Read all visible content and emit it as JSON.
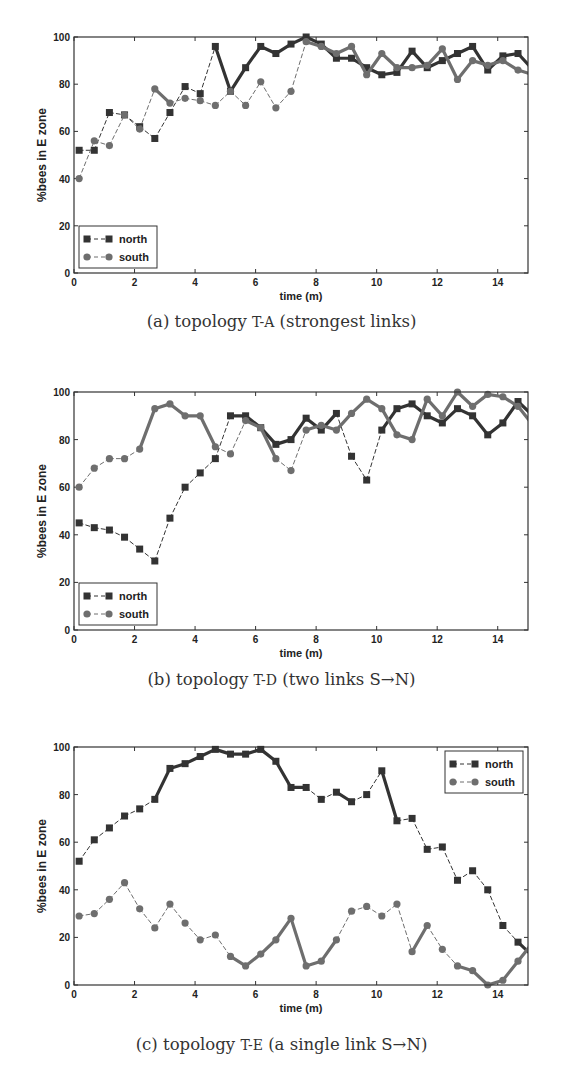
{
  "chart_data": [
    {
      "type": "line",
      "panel": "a",
      "caption_prefix": "(a) topology ",
      "caption_topology": "T-A",
      "caption_suffix": " (strongest links)",
      "xlabel": "time (m)",
      "ylabel": "%bees in E zone",
      "xlim": [
        0,
        15
      ],
      "ylim": [
        0,
        100
      ],
      "xticks": [
        0,
        2,
        4,
        6,
        8,
        10,
        12,
        14
      ],
      "yticks": [
        0,
        20,
        40,
        60,
        80,
        100
      ],
      "grid": false,
      "legend_position": "lower left",
      "x": [
        0.17,
        0.67,
        1.17,
        1.67,
        2.17,
        2.67,
        3.17,
        3.67,
        4.17,
        4.67,
        5.17,
        5.67,
        6.17,
        6.67,
        7.17,
        7.67,
        8.17,
        8.67,
        9.17,
        9.67,
        10.17,
        10.67,
        11.17,
        11.67,
        12.17,
        12.67,
        13.17,
        13.67,
        14.17,
        14.67,
        15.17
      ],
      "series": [
        {
          "name": "north",
          "marker": "square",
          "color": "#333333",
          "values": [
            52,
            52,
            68,
            67,
            62,
            57,
            68,
            79,
            76,
            96,
            77,
            87,
            96,
            93,
            97,
            100,
            97,
            91,
            91,
            87,
            84,
            85,
            94,
            87,
            90,
            93,
            96,
            86,
            92,
            93,
            86
          ],
          "solid": [
            0,
            0,
            0,
            0,
            0,
            0,
            0,
            0,
            0,
            1,
            1,
            1,
            1,
            1,
            1,
            1,
            1,
            1,
            1,
            1,
            1,
            1,
            1,
            1,
            1,
            1,
            1,
            1,
            1,
            1
          ]
        },
        {
          "name": "south",
          "marker": "circle",
          "color": "#6e6e6e",
          "values": [
            40,
            56,
            54,
            67,
            61,
            78,
            72,
            74,
            73,
            71,
            77,
            71,
            81,
            70,
            77,
            98,
            96,
            93,
            96,
            84,
            93,
            87,
            87,
            88,
            95,
            82,
            90,
            88,
            90,
            86,
            84
          ],
          "solid": [
            0,
            0,
            0,
            0,
            0,
            1,
            0,
            0,
            0,
            0,
            0,
            0,
            0,
            0,
            0,
            1,
            1,
            1,
            1,
            1,
            1,
            1,
            1,
            1,
            1,
            1,
            1,
            1,
            1,
            1
          ]
        }
      ]
    },
    {
      "type": "line",
      "panel": "b",
      "caption_prefix": "(b) topology ",
      "caption_topology": "T-D",
      "caption_suffix": " (two links S→N)",
      "xlabel": "time (m)",
      "ylabel": "%bees in E zone",
      "xlim": [
        0,
        15
      ],
      "ylim": [
        0,
        100
      ],
      "xticks": [
        0,
        2,
        4,
        6,
        8,
        10,
        12,
        14
      ],
      "yticks": [
        0,
        20,
        40,
        60,
        80,
        100
      ],
      "grid": false,
      "legend_position": "lower left",
      "x": [
        0.17,
        0.67,
        1.17,
        1.67,
        2.17,
        2.67,
        3.17,
        3.67,
        4.17,
        4.67,
        5.17,
        5.67,
        6.17,
        6.67,
        7.17,
        7.67,
        8.17,
        8.67,
        9.17,
        9.67,
        10.17,
        10.67,
        11.17,
        11.67,
        12.17,
        12.67,
        13.17,
        13.67,
        14.17,
        14.67,
        15.17
      ],
      "series": [
        {
          "name": "north",
          "marker": "square",
          "color": "#333333",
          "values": [
            45,
            43,
            42,
            39,
            34,
            29,
            47,
            60,
            66,
            72,
            90,
            90,
            85,
            78,
            80,
            89,
            84,
            91,
            73,
            63,
            84,
            93,
            95,
            90,
            87,
            93,
            90,
            82,
            87,
            96,
            90
          ],
          "solid": [
            0,
            0,
            0,
            0,
            0,
            0,
            0,
            0,
            0,
            0,
            1,
            1,
            1,
            1,
            1,
            1,
            1,
            0,
            0,
            0,
            1,
            1,
            1,
            1,
            1,
            1,
            1,
            1,
            1,
            1
          ]
        },
        {
          "name": "south",
          "marker": "circle",
          "color": "#6e6e6e",
          "values": [
            60,
            68,
            72,
            72,
            76,
            93,
            95,
            90,
            90,
            77,
            74,
            88,
            85,
            72,
            67,
            84,
            86,
            84,
            91,
            97,
            93,
            82,
            80,
            97,
            90,
            100,
            94,
            99,
            98,
            94,
            86
          ],
          "solid": [
            0,
            0,
            0,
            0,
            1,
            1,
            1,
            1,
            1,
            0,
            0,
            1,
            1,
            0,
            0,
            1,
            1,
            1,
            1,
            1,
            1,
            1,
            1,
            1,
            1,
            1,
            1,
            1,
            1,
            1
          ]
        }
      ]
    },
    {
      "type": "line",
      "panel": "c",
      "caption_prefix": "(c) topology ",
      "caption_topology": "T-E",
      "caption_suffix": " (a single link S→N)",
      "xlabel": "time (m)",
      "ylabel": "%bees in E zone",
      "xlim": [
        0,
        15
      ],
      "ylim": [
        0,
        100
      ],
      "xticks": [
        0,
        2,
        4,
        6,
        8,
        10,
        12,
        14
      ],
      "yticks": [
        0,
        20,
        40,
        60,
        80,
        100
      ],
      "grid": false,
      "legend_position": "upper right",
      "x": [
        0.17,
        0.67,
        1.17,
        1.67,
        2.17,
        2.67,
        3.17,
        3.67,
        4.17,
        4.67,
        5.17,
        5.67,
        6.17,
        6.67,
        7.17,
        7.67,
        8.17,
        8.67,
        9.17,
        9.67,
        10.17,
        10.67,
        11.17,
        11.67,
        12.17,
        12.67,
        13.17,
        13.67,
        14.17,
        14.67,
        15.17
      ],
      "series": [
        {
          "name": "north",
          "marker": "square",
          "color": "#333333",
          "values": [
            52,
            61,
            66,
            71,
            74,
            78,
            91,
            93,
            96,
            99,
            97,
            97,
            99,
            94,
            83,
            83,
            78,
            81,
            77,
            80,
            90,
            69,
            70,
            57,
            58,
            44,
            48,
            40,
            25,
            18,
            12
          ],
          "solid": [
            0,
            0,
            0,
            0,
            0,
            1,
            1,
            1,
            1,
            1,
            1,
            1,
            1,
            1,
            1,
            0,
            0,
            1,
            0,
            0,
            1,
            0,
            0,
            0,
            0,
            0,
            0,
            0,
            0,
            1
          ]
        },
        {
          "name": "south",
          "marker": "circle",
          "color": "#6e6e6e",
          "values": [
            29,
            30,
            36,
            43,
            32,
            24,
            34,
            26,
            19,
            21,
            12,
            8,
            13,
            19,
            28,
            8,
            10,
            19,
            31,
            33,
            29,
            34,
            14,
            25,
            15,
            8,
            6,
            0,
            2,
            10,
            18
          ],
          "solid": [
            0,
            0,
            0,
            0,
            0,
            0,
            0,
            0,
            0,
            0,
            1,
            1,
            1,
            1,
            1,
            1,
            1,
            0,
            0,
            0,
            0,
            0,
            1,
            0,
            0,
            1,
            1,
            1,
            1,
            1
          ]
        }
      ]
    }
  ]
}
